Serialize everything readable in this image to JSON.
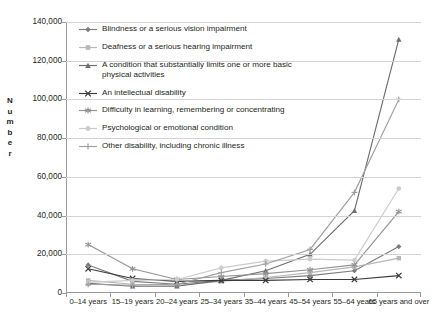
{
  "chart_data": {
    "type": "line",
    "title": "",
    "xlabel": "",
    "ylabel": "Number",
    "ylim": [
      0,
      140000
    ],
    "ytick_step": 20000,
    "grid": true,
    "legend_position": "inside-top-left",
    "categories": [
      "0–14 years",
      "15–19 years",
      "20–24 years",
      "25–34 years",
      "35–44 years",
      "45–54 years",
      "55–64 years",
      "65 years and over"
    ],
    "ytick_labels": [
      "0",
      "20,000",
      "40,000",
      "60,000",
      "80,000",
      "100,000",
      "120,000",
      "140,000"
    ],
    "series": [
      {
        "name": "Blindness or a serious vision impairment",
        "marker": "diamond",
        "color": "#7d7d7d",
        "values": [
          14500,
          6000,
          4500,
          6500,
          7500,
          9000,
          11500,
          24000
        ]
      },
      {
        "name": "Deafness or a serious hearing impairment",
        "marker": "square",
        "color": "#b7b7b7",
        "values": [
          6500,
          4500,
          4000,
          6000,
          8000,
          10500,
          13500,
          18000
        ]
      },
      {
        "name": "A condition that substantially limits one or more basic physical activities",
        "marker": "triangle",
        "color": "#6e6e6e",
        "values": [
          5000,
          3500,
          3500,
          6500,
          11500,
          20000,
          42500,
          131000
        ]
      },
      {
        "name": "An intellectual disability",
        "marker": "x",
        "color": "#3a3a3a",
        "values": [
          12500,
          7500,
          6000,
          6500,
          6500,
          7000,
          7000,
          9000
        ]
      },
      {
        "name": "Difficulty in learning, remembering or concentrating",
        "marker": "asterisk",
        "color": "#949494",
        "values": [
          25000,
          12500,
          7000,
          8500,
          10000,
          12000,
          14500,
          42000
        ]
      },
      {
        "name": "Psychological or emotional condition",
        "marker": "circle",
        "color": "#cccccc",
        "values": [
          5500,
          6500,
          7000,
          13000,
          16500,
          17500,
          17000,
          54000
        ]
      },
      {
        "name": "Other disability, including chronic illness",
        "marker": "plus",
        "color": "#a0a0a0",
        "values": [
          4500,
          4000,
          4500,
          10500,
          15000,
          22500,
          52000,
          100000
        ]
      }
    ]
  }
}
